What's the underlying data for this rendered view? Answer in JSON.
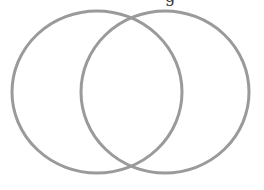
{
  "diagram": {
    "type": "venn",
    "sets": [
      {
        "name": "left-set",
        "label": "",
        "cx": 97,
        "cy": 92,
        "rx": 85,
        "ry": 81
      },
      {
        "name": "right-set",
        "label": "",
        "cx": 165,
        "cy": 92,
        "rx": 84,
        "ry": 81
      }
    ],
    "stroke_color": "#9a9a9a",
    "stroke_width": 3,
    "background": "#ffffff",
    "clipped_text_fragment": "g"
  }
}
